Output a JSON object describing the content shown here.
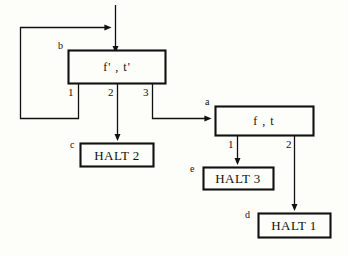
{
  "diagram": {
    "background_color": "#fdfdfa",
    "stroke_color": "#111111",
    "nodes": [
      {
        "id": "b",
        "tag": "b",
        "label": "f' , t'",
        "kind": "process",
        "x": 68,
        "y": 50,
        "w": 97,
        "h": 33,
        "ports": [
          {
            "label": "1",
            "x": 78
          },
          {
            "label": "2",
            "x": 118
          },
          {
            "label": "3",
            "x": 153
          }
        ]
      },
      {
        "id": "a",
        "tag": "a",
        "label": "f , t",
        "kind": "process",
        "x": 215,
        "y": 106,
        "w": 98,
        "h": 29,
        "ports": [
          {
            "label": "1",
            "x": 237
          },
          {
            "label": "2",
            "x": 295
          }
        ]
      },
      {
        "id": "c",
        "tag": "c",
        "label": "HALT 2",
        "kind": "terminal",
        "x": 80,
        "y": 143,
        "w": 73,
        "h": 23,
        "ports": []
      },
      {
        "id": "e",
        "tag": "e",
        "label": "HALT 3",
        "kind": "terminal",
        "x": 203,
        "y": 167,
        "w": 70,
        "h": 22,
        "ports": []
      },
      {
        "id": "d",
        "tag": "d",
        "label": "HALT 1",
        "kind": "terminal",
        "x": 258,
        "y": 213,
        "w": 72,
        "h": 24,
        "ports": []
      }
    ],
    "edges": [
      {
        "name": "entry-arrow-into-b",
        "from": "top-entry",
        "to": "b"
      },
      {
        "name": "feedback-loop-port1-to-entry",
        "from": "b.1",
        "to": "top-entry"
      },
      {
        "name": "b-port2-to-halt2",
        "from": "b.2",
        "to": "c"
      },
      {
        "name": "b-port3-to-a",
        "from": "b.3",
        "to": "a"
      },
      {
        "name": "a-port1-to-halt3",
        "from": "a.1",
        "to": "e"
      },
      {
        "name": "a-port2-to-halt1",
        "from": "a.2",
        "to": "d"
      }
    ]
  }
}
